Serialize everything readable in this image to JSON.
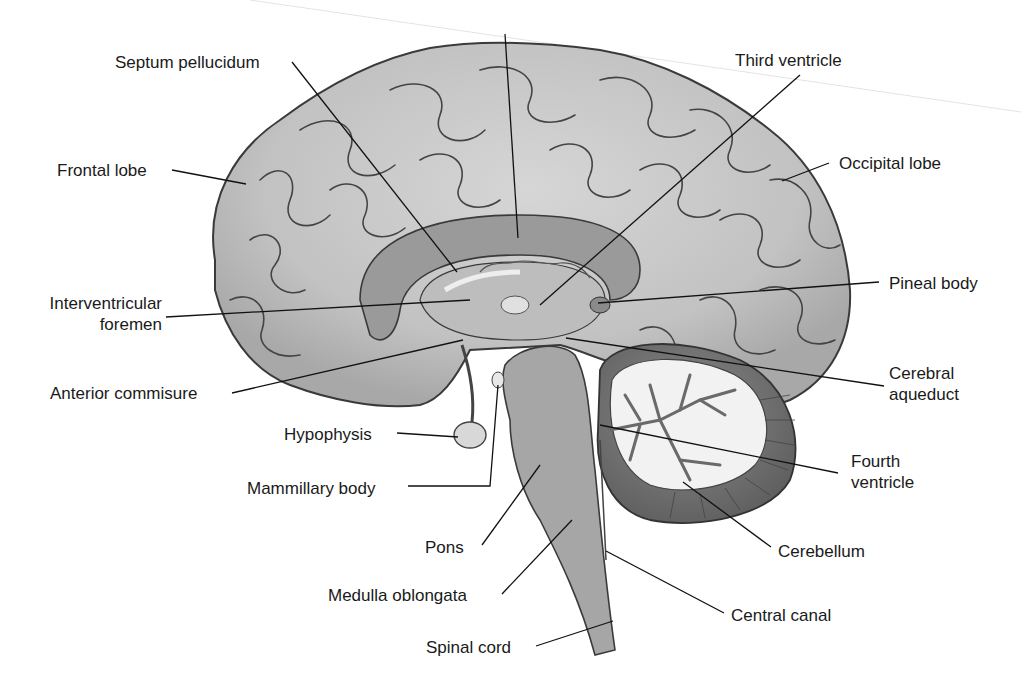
{
  "diagram": {
    "type": "anatomical-illustration",
    "colors": {
      "background": "#ffffff",
      "cortex_light": "#c9c9c9",
      "cortex_mid": "#a9a9a9",
      "cortex_dark": "#8a8a8a",
      "gyrus_outline": "#3a3a3a",
      "corpus_callosum": "#9a9a9a",
      "ventricle": "#bdbdbd",
      "brainstem": "#a6a6a6",
      "cerebellum_outer": "#6e6e6e",
      "cerebellum_white": "#f2f2f2",
      "leader_line": "#111111",
      "label_text": "#1a1a1a"
    },
    "labels": [
      {
        "id": "septum-pellucidum",
        "text": "Septum pellucidum",
        "x": 115,
        "y": 52,
        "align": "left",
        "line": [
          [
            292,
            62
          ],
          [
            457,
            272
          ]
        ]
      },
      {
        "id": "corpus-callosum-unlabeled",
        "text": "",
        "x": 505,
        "y": 20,
        "align": "left",
        "line": [
          [
            505,
            34
          ],
          [
            518,
            238
          ]
        ]
      },
      {
        "id": "third-ventricle",
        "text": "Third ventricle",
        "x": 735,
        "y": 50,
        "align": "left",
        "line": [
          [
            800,
            75
          ],
          [
            540,
            305
          ]
        ]
      },
      {
        "id": "frontal-lobe",
        "text": "Frontal lobe",
        "x": 57,
        "y": 160,
        "align": "left",
        "line": [
          [
            172,
            170
          ],
          [
            246,
            184
          ]
        ]
      },
      {
        "id": "occipital-lobe",
        "text": "Occipital lobe",
        "x": 839,
        "y": 153,
        "align": "left",
        "line": [
          [
            829,
            163
          ],
          [
            782,
            181
          ]
        ]
      },
      {
        "id": "pineal-body",
        "text": "Pineal body",
        "x": 889,
        "y": 273,
        "align": "left",
        "line": [
          [
            879,
            282
          ],
          [
            598,
            303
          ]
        ]
      },
      {
        "id": "interventricular-foremen",
        "text": "Interventricular\nforemen",
        "x": 23,
        "y": 293,
        "align": "right",
        "line": [
          [
            166,
            317
          ],
          [
            470,
            300
          ]
        ]
      },
      {
        "id": "cerebral-aqueduct",
        "text": "Cerebral\naqueduct",
        "x": 889,
        "y": 363,
        "align": "left",
        "line": [
          [
            884,
            386
          ],
          [
            566,
            338
          ]
        ]
      },
      {
        "id": "anterior-commisure",
        "text": "Anterior commisure",
        "x": 50,
        "y": 383,
        "align": "left",
        "line": [
          [
            232,
            393
          ],
          [
            463,
            340
          ]
        ]
      },
      {
        "id": "hypophysis",
        "text": "Hypophysis",
        "x": 284,
        "y": 424,
        "align": "left",
        "line": [
          [
            397,
            433
          ],
          [
            458,
            437
          ]
        ]
      },
      {
        "id": "fourth-ventricle",
        "text": "Fourth\nventricle",
        "x": 851,
        "y": 451,
        "align": "left",
        "line": [
          [
            838,
            473
          ],
          [
            600,
            425
          ]
        ]
      },
      {
        "id": "mammillary-body",
        "text": "Mammillary body",
        "x": 247,
        "y": 478,
        "align": "left",
        "line": [
          [
            408,
            486
          ],
          [
            490,
            486
          ],
          [
            498,
            385
          ]
        ]
      },
      {
        "id": "cerebellum",
        "text": "Cerebellum",
        "x": 778,
        "y": 541,
        "align": "left",
        "line": [
          [
            771,
            547
          ],
          [
            683,
            482
          ]
        ]
      },
      {
        "id": "pons",
        "text": "Pons",
        "x": 425,
        "y": 537,
        "align": "left",
        "line": [
          [
            482,
            545
          ],
          [
            540,
            465
          ]
        ]
      },
      {
        "id": "medulla-oblongata",
        "text": "Medulla oblongata",
        "x": 328,
        "y": 585,
        "align": "left",
        "line": [
          [
            502,
            594
          ],
          [
            572,
            520
          ]
        ]
      },
      {
        "id": "central-canal",
        "text": "Central canal",
        "x": 731,
        "y": 605,
        "align": "left",
        "line": [
          [
            724,
            613
          ],
          [
            606,
            551
          ]
        ]
      },
      {
        "id": "spinal-cord",
        "text": "Spinal cord",
        "x": 426,
        "y": 637,
        "align": "left",
        "line": [
          [
            536,
            646
          ],
          [
            613,
            621
          ]
        ]
      }
    ]
  }
}
